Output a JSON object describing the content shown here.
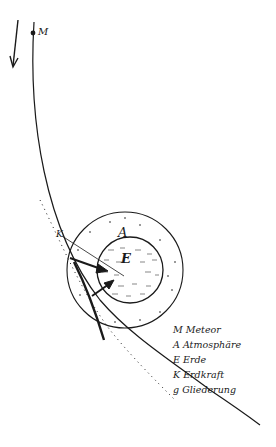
{
  "diagram": {
    "labels": {
      "meteor": "M",
      "atmosphere": "A",
      "earth": "E",
      "gravity": "K"
    },
    "legend": [
      {
        "key": "M",
        "text": "Meteor"
      },
      {
        "key": "A",
        "text": "Atmosphäre"
      },
      {
        "key": "E",
        "text": "Erde"
      },
      {
        "key": "K",
        "text": "Erdkraft"
      },
      {
        "key": "g",
        "text": "Gliederung"
      }
    ],
    "colors": {
      "ink": "#1a1a1a",
      "paper": "#ffffff"
    }
  }
}
